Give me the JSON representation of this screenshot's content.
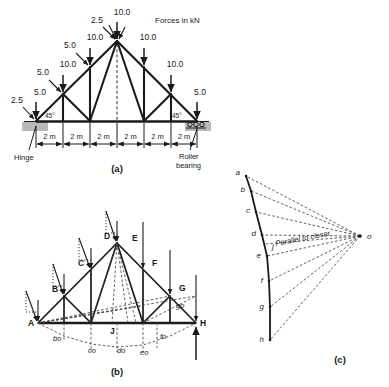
{
  "figure": {
    "note": "Forces in kN",
    "captions": {
      "a": "(a)",
      "b": "(b)",
      "c": "(c)"
    }
  },
  "panel_a": {
    "name": "loaded-truss-diagram",
    "loads": [
      {
        "label": "2.5",
        "node": "A-outer"
      },
      {
        "label": "5.0",
        "node": "A"
      },
      {
        "label": "5.0",
        "node": "B-upper"
      },
      {
        "label": "10.0",
        "node": "B"
      },
      {
        "label": "5.0",
        "node": "C-upper"
      },
      {
        "label": "10.0",
        "node": "C"
      },
      {
        "label": "2.5",
        "node": "D-upper"
      },
      {
        "label": "10.0",
        "node": "D-apex"
      },
      {
        "label": "10.0",
        "node": "E"
      },
      {
        "label": "10.0",
        "node": "F"
      },
      {
        "label": "5.0",
        "node": "H"
      }
    ],
    "angles": {
      "left": "45°",
      "right": "45°"
    },
    "dimensions": [
      "2 m",
      "2 m",
      "2 m",
      "2 m",
      "2 m",
      "2 m"
    ],
    "supports": {
      "left": "Hinge",
      "right": "Roller\nbearing",
      "left_label": "Hinge",
      "right_label_1": "Roller",
      "right_label_2": "bearing"
    }
  },
  "panel_b": {
    "name": "bow-notation-truss",
    "joint_labels": [
      "A",
      "B",
      "C",
      "D",
      "E",
      "F",
      "G",
      "H",
      "J"
    ],
    "construction_labels": [
      "bo",
      "co",
      "do",
      "eo",
      "fo",
      "go"
    ]
  },
  "panel_c": {
    "name": "maxwell-force-polygon",
    "vertices": [
      "a",
      "b",
      "c",
      "d",
      "e",
      "f",
      "g",
      "h",
      "j"
    ],
    "pole": "o",
    "annotation": "Parallel to closer"
  }
}
